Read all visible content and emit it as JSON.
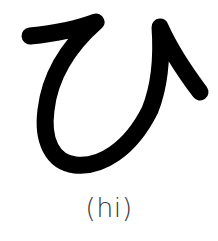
{
  "kana": {
    "character": "ひ",
    "script": "hiragana",
    "romaji_label": "(hi)",
    "stroke_color": "#000000",
    "label_color": "#3a3a3a",
    "background": "#ffffff"
  }
}
